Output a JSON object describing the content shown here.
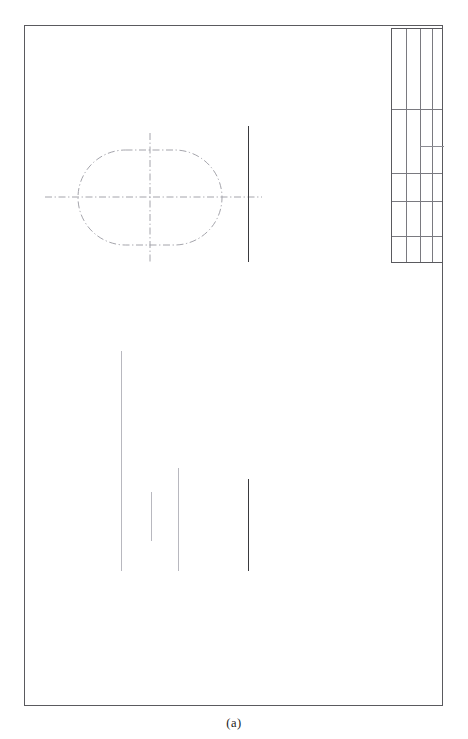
{
  "figure": {
    "caption": "(a)",
    "kind": "engineering-drawing-sheet"
  },
  "sheet": {
    "background_color": "#ffffff",
    "width": 468,
    "height": 739
  },
  "frame": {
    "name": "drawing-border",
    "x": 24,
    "y": 25,
    "width": 419,
    "height": 681,
    "stroke_color": "#5a5a5e",
    "stroke_width": 1
  },
  "title_block": {
    "name": "title-block",
    "x": 391,
    "y": 28,
    "width": 52,
    "height": 235,
    "stroke_color": "#5a5a5e",
    "inner_stroke_color": "#7a7a80",
    "columns": [
      {
        "name": "tb-col-1",
        "x": 14
      },
      {
        "name": "tb-col-2",
        "x": 28
      },
      {
        "name": "tb-col-3",
        "x": 40
      }
    ],
    "rows": [
      {
        "name": "tb-row-1",
        "y": 80
      },
      {
        "name": "tb-row-2",
        "y": 144
      },
      {
        "name": "tb-row-3",
        "y": 172
      },
      {
        "name": "tb-row-4",
        "y": 207
      }
    ],
    "partial_rows": [
      {
        "name": "tb-partial-row-1",
        "y": 117,
        "x": 28,
        "width": 24
      }
    ],
    "cells_text": []
  },
  "geometry": {
    "obround": {
      "name": "obround-outline",
      "x": 78,
      "y": 150,
      "width": 144,
      "height": 95,
      "radius": 47.5,
      "line_style": "dash-dot",
      "stroke_color": "#9a9aa2",
      "stroke_width": 0.9
    },
    "centerlines": [
      {
        "name": "centerline-horizontal",
        "orientation": "horizontal",
        "x1": 45,
        "y1": 197,
        "x2": 262,
        "y2": 197,
        "line_style": "dash-dot",
        "stroke_color": "#9a9aa2",
        "stroke_width": 0.9
      },
      {
        "name": "centerline-vertical",
        "orientation": "vertical",
        "x1": 150,
        "y1": 133,
        "x2": 150,
        "y2": 262,
        "line_style": "dash-dot",
        "stroke_color": "#9a9aa2",
        "stroke_width": 0.9
      }
    ],
    "solid_lines": [
      {
        "name": "upper-right-vertical-line",
        "x": 248,
        "y_top": 126,
        "y_bottom": 262,
        "stroke_color": "#3a3a3e",
        "stroke_width": 1
      },
      {
        "name": "lower-line-1",
        "x": 121,
        "y_top": 351,
        "y_bottom": 571,
        "stroke_color": "#b0b0b7",
        "stroke_width": 1
      },
      {
        "name": "lower-line-2",
        "x": 151,
        "y_top": 492,
        "y_bottom": 541,
        "stroke_color": "#b0b0b7",
        "stroke_width": 1
      },
      {
        "name": "lower-line-3",
        "x": 178,
        "y_top": 468,
        "y_bottom": 571,
        "stroke_color": "#b0b0b7",
        "stroke_width": 1
      },
      {
        "name": "lower-line-4",
        "x": 248,
        "y_top": 479,
        "y_bottom": 571,
        "stroke_color": "#3a3a3e",
        "stroke_width": 1
      }
    ]
  }
}
